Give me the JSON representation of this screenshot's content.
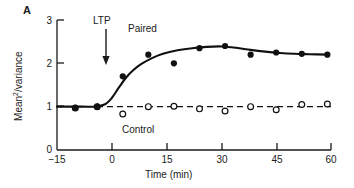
{
  "panel": {
    "label": "A"
  },
  "axes": {
    "x": {
      "title": "Time (min)",
      "ticks": [
        -15,
        0,
        15,
        30,
        45,
        60
      ],
      "tick_labels": [
        "−15",
        "0",
        "15",
        "30",
        "45",
        "60"
      ],
      "range": [
        -15,
        60
      ]
    },
    "y": {
      "title_prefix": "Mean",
      "title_sup": "2",
      "title_suffix": "/variance",
      "ticks": [
        0,
        1,
        2,
        3
      ],
      "tick_labels": [
        "0",
        "1",
        "2",
        "3"
      ],
      "range": [
        0,
        3
      ]
    }
  },
  "annotations": {
    "ltp": "LTP",
    "ltp_time": 0,
    "paired": "Paired",
    "control": "Control"
  },
  "colors": {
    "axis": "#1a1a1a",
    "paired": "#111111",
    "control": "#111111",
    "background": "#ffffff"
  },
  "chart_data": {
    "type": "scatter",
    "title": "",
    "xlabel": "Time (min)",
    "ylabel": "Mean^2/variance",
    "xlim": [
      -15,
      60
    ],
    "ylim": [
      0,
      3
    ],
    "grid": false,
    "legend": "inline-labels",
    "annotations": [
      {
        "text": "LTP",
        "x": 0,
        "y": 2.75,
        "type": "arrow-down",
        "arrow_to_y": 2.0
      },
      {
        "text": "Paired",
        "x": 12,
        "y": 2.85
      },
      {
        "text": "Control",
        "x": 10,
        "y": 0.65
      }
    ],
    "series": [
      {
        "name": "Paired",
        "marker": "filled-circle",
        "line": "solid-fitted-curve",
        "x": [
          -10,
          -4,
          3,
          10,
          17,
          24,
          31,
          38,
          45,
          52,
          59
        ],
        "y": [
          0.97,
          1.0,
          1.7,
          2.2,
          2.0,
          2.35,
          2.4,
          2.2,
          2.25,
          2.22,
          2.2
        ]
      },
      {
        "name": "Control",
        "marker": "open-circle",
        "line": "dashed",
        "x": [
          -10,
          -4,
          3,
          10,
          17,
          24,
          31,
          38,
          45,
          52,
          59
        ],
        "y": [
          0.97,
          1.0,
          0.83,
          1.0,
          1.01,
          0.95,
          0.9,
          1.0,
          0.93,
          1.05,
          1.06
        ]
      }
    ],
    "fitted_curve": {
      "series": "Paired",
      "points_x": [
        -15,
        -8,
        -5,
        -2,
        0,
        2,
        4,
        6,
        8,
        11,
        14,
        18,
        22,
        26,
        30,
        34,
        38,
        42,
        46,
        50,
        54,
        59
      ],
      "points_y": [
        1.0,
        1.0,
        1.0,
        1.05,
        1.2,
        1.45,
        1.68,
        1.85,
        1.98,
        2.12,
        2.22,
        2.3,
        2.35,
        2.38,
        2.39,
        2.36,
        2.31,
        2.27,
        2.24,
        2.22,
        2.21,
        2.2
      ]
    },
    "control_baseline_y": 1.0
  }
}
